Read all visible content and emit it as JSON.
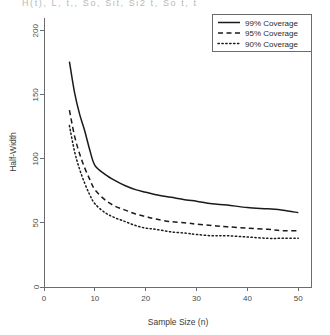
{
  "figure": {
    "clipped_top_text": "H(t), L, t,, So, Sit, Si2 t, So    t, t",
    "plot_area": {
      "left": 44,
      "top": 18,
      "right": 311,
      "bottom": 287
    }
  },
  "chart_data": {
    "type": "line",
    "title": "",
    "xlabel": "Sample Size (n)",
    "ylabel": "Half-Width",
    "xlim": [
      0,
      52.5
    ],
    "ylim": [
      0,
      210
    ],
    "xticks": [
      0,
      10,
      20,
      30,
      40,
      50
    ],
    "xticklabels": [
      "0",
      "10",
      "20",
      "30",
      "40",
      "50"
    ],
    "yticks": [
      0,
      50,
      100,
      150,
      200
    ],
    "yticklabels": [
      "0",
      "50",
      "100",
      "150",
      "200"
    ],
    "grid": false,
    "legend_position": "top-right",
    "x": [
      5,
      6,
      7,
      8,
      9,
      10,
      12,
      14,
      16,
      18,
      20,
      22,
      25,
      28,
      30,
      33,
      36,
      40,
      44,
      47,
      50
    ],
    "series": [
      {
        "name": "99% Coverage",
        "linestyle": "solid",
        "color": "#1a1a1a",
        "values": [
          176,
          152,
          135,
          122,
          107,
          95,
          88,
          83,
          79,
          76,
          74,
          72,
          70,
          68,
          67,
          65,
          64,
          62,
          61,
          60,
          58
        ]
      },
      {
        "name": "95% Coverage",
        "linestyle": "dashed",
        "color": "#1a1a1a",
        "values": [
          138,
          118,
          104,
          93,
          84,
          76,
          68,
          63,
          60,
          57,
          55,
          53,
          51,
          50,
          49,
          48,
          47,
          46,
          45,
          44,
          44
        ]
      },
      {
        "name": "90% Coverage",
        "linestyle": "dotted",
        "color": "#1a1a1a",
        "values": [
          126,
          106,
          92,
          81,
          72,
          65,
          58,
          54,
          51,
          48,
          46,
          45,
          43,
          42,
          41,
          40,
          40,
          39,
          38,
          38,
          38
        ]
      }
    ]
  },
  "legend": {
    "entries": [
      {
        "label": "99% Coverage",
        "style": "solid"
      },
      {
        "label": "95% Coverage",
        "style": "dashed"
      },
      {
        "label": "90% Coverage",
        "style": "dotted"
      }
    ]
  }
}
